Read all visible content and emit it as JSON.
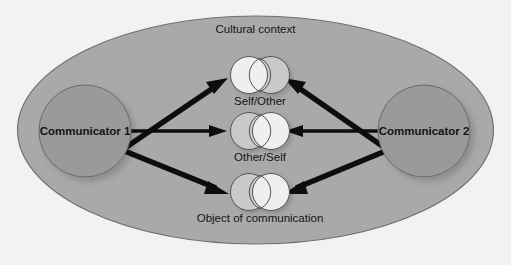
{
  "figure": {
    "title": "Cultural context",
    "background_color": "#f2f2f2",
    "context_ellipse_color": "#a9a9a9",
    "context_ellipse_stroke": "#6e6e6e",
    "communicator_color": "#9a9a9a",
    "communicator_stroke": "#6a6a6a",
    "arrow_color": "#0d0d0d",
    "circle_bright_color": "#efefef",
    "circle_tinted_color": "#c9c9c9",
    "circle_stroke": "#555555"
  },
  "communicators": [
    {
      "id": "communicator-1",
      "label": "Communicator 1",
      "side": "left"
    },
    {
      "id": "communicator-2",
      "label": "Communicator 2",
      "side": "right"
    }
  ],
  "pairs": [
    {
      "id": "self-other",
      "label": "Self/Other",
      "left_circle": "bright",
      "right_circle": "tinted",
      "row": "top"
    },
    {
      "id": "other-self",
      "label": "Other/Self",
      "left_circle": "tinted",
      "right_circle": "bright",
      "row": "middle"
    },
    {
      "id": "object-of-communication",
      "label": "Object of communication",
      "left_circle": "tinted",
      "right_circle": "bright",
      "row": "bottom"
    }
  ],
  "arrows": [
    {
      "id": "arrow-c1-to-self-other",
      "from": "communicator-1",
      "to": "self-other",
      "direction": "right-up"
    },
    {
      "id": "arrow-c1-to-other-self",
      "from": "communicator-1",
      "to": "other-self",
      "direction": "right"
    },
    {
      "id": "arrow-c1-to-object",
      "from": "communicator-1",
      "to": "object-of-communication",
      "direction": "right-down"
    },
    {
      "id": "arrow-c2-to-self-other",
      "from": "communicator-2",
      "to": "self-other",
      "direction": "left-up"
    },
    {
      "id": "arrow-c2-to-other-self",
      "from": "communicator-2",
      "to": "other-self",
      "direction": "left"
    },
    {
      "id": "arrow-c2-to-object",
      "from": "communicator-2",
      "to": "object-of-communication",
      "direction": "left-down"
    }
  ]
}
